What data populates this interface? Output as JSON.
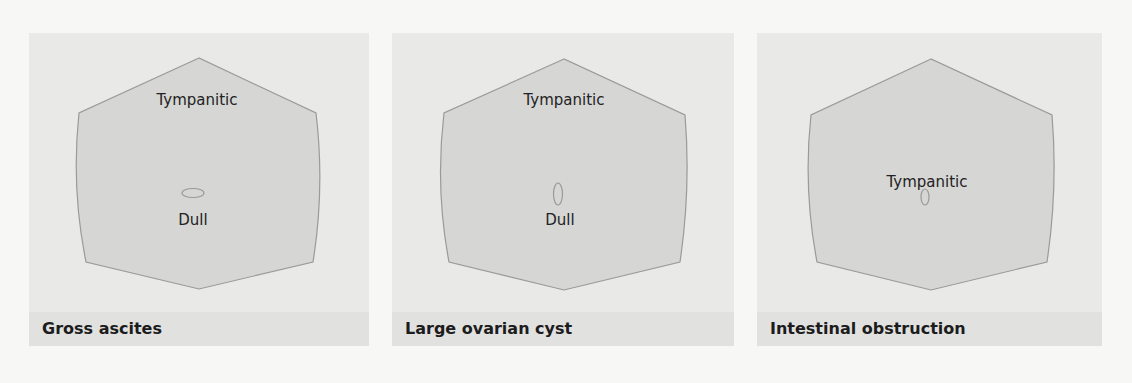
{
  "figure": {
    "panels": [
      {
        "caption": "Gross ascites",
        "upper_label": "Tympanitic",
        "lower_label": "Dull",
        "umbilicus_shape": "horizontal-oval"
      },
      {
        "caption": "Large ovarian cyst",
        "upper_label": "Tympanitic",
        "lower_label": "Dull",
        "umbilicus_shape": "vertical-oval"
      },
      {
        "caption": "Intestinal obstruction",
        "center_label": "Tympanitic",
        "umbilicus_shape": "vertical-oval"
      }
    ],
    "colors": {
      "background": "#f7f7f6",
      "panel": "#e9e9e8",
      "caption_band": "#e1e1e0",
      "abdomen_fill": "#d6d6d5",
      "abdomen_stroke": "#9a9a99"
    }
  }
}
